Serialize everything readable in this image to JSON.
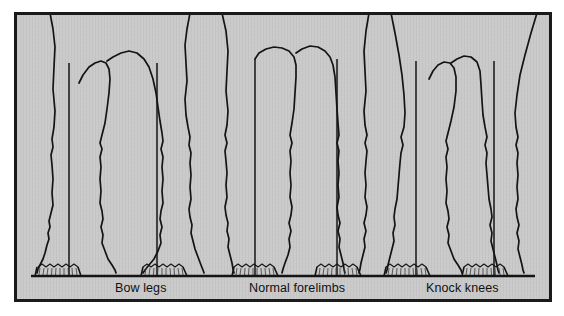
{
  "figure": {
    "background_color": "#c9c9c9",
    "frame_color": "#1a1a1a",
    "ink_color": "#141414",
    "page_color": "#ffffff"
  },
  "captions": [
    {
      "id": "bow-legs",
      "label": "Bow legs"
    },
    {
      "id": "normal-forelimbs",
      "label": "Normal forelimbs"
    },
    {
      "id": "knock-knees",
      "label": "Knock knees"
    }
  ],
  "groups": [
    {
      "id": "bow-legs",
      "label": "Bow legs",
      "description": "Carpi deviate laterally; plumb lines fall medial to the knees and outside the hooves.",
      "legs": 2,
      "plumb_lines": 2
    },
    {
      "id": "normal-forelimbs",
      "label": "Normal forelimbs",
      "description": "Plumb line bisects forearm, knee, cannon, fetlock and hoof.",
      "legs": 2,
      "plumb_lines": 2
    },
    {
      "id": "knock-knees",
      "label": "Knock knees",
      "description": "Carpi deviate medially; plumb lines fall lateral to the knees.",
      "legs": 2,
      "plumb_lines": 2
    }
  ],
  "ground": {
    "label": "ground line",
    "y": 260
  }
}
